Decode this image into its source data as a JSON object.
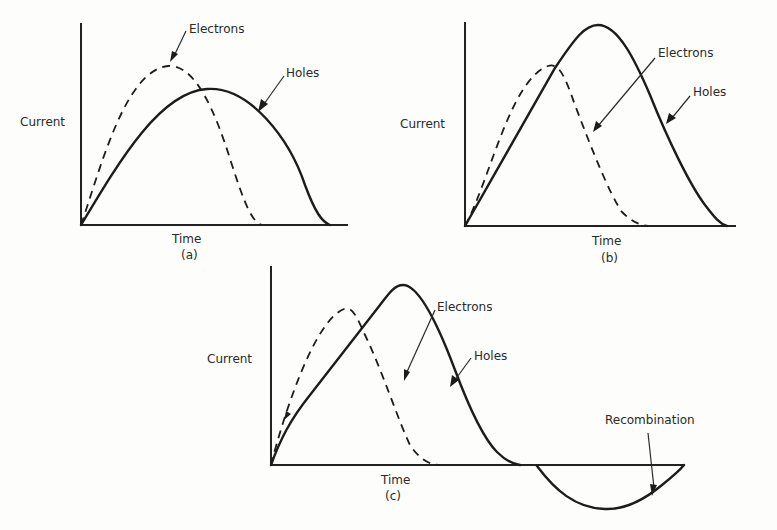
{
  "figure": {
    "panels": [
      {
        "id": "a",
        "caption": "(a)",
        "xlabel": "Time",
        "ylabel": "Current",
        "annotations": {
          "electrons": "Electrons",
          "holes": "Holes"
        }
      },
      {
        "id": "b",
        "caption": "(b)",
        "xlabel": "Time",
        "ylabel": "Current",
        "annotations": {
          "electrons": "Electrons",
          "holes": "Holes"
        }
      },
      {
        "id": "c",
        "caption": "(c)",
        "xlabel": "Time",
        "ylabel": "Current",
        "annotations": {
          "electrons": "Electrons",
          "holes": "Holes",
          "recombination": "Recombination"
        }
      }
    ],
    "legend": {
      "electrons_style": "dashed",
      "holes_style": "solid"
    },
    "colors": {
      "line": "#1c1c1c",
      "background": "#fdfdfb"
    }
  }
}
